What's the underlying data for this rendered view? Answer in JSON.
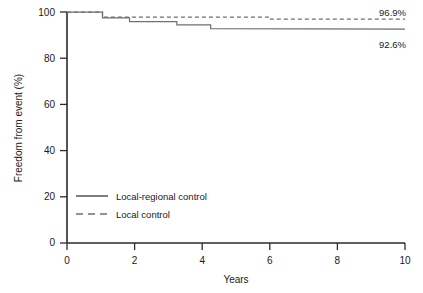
{
  "chart_data": {
    "type": "line",
    "title": "",
    "subtitle": "",
    "xlabel": "Years",
    "ylabel": "Freedom from event (%)",
    "xlim": [
      0,
      10
    ],
    "ylim": [
      0,
      100
    ],
    "xticks": [
      "0",
      "2",
      "4",
      "6",
      "8",
      "10"
    ],
    "xtick_values": [
      0,
      2,
      4,
      6,
      8,
      10
    ],
    "yticks": [
      "0",
      "20",
      "40",
      "60",
      "80",
      "100"
    ],
    "ytick_values": [
      0,
      20,
      40,
      60,
      80,
      100
    ],
    "grid": false,
    "legend_position": "inside-lower-left",
    "series": [
      {
        "name": "Local-regional control",
        "style": "solid",
        "color": "#6f6f6f",
        "endpoint_label": "92.6%",
        "endpoint_value": 92.6,
        "step_points": [
          [
            0.0,
            100.0
          ],
          [
            1.05,
            100.0
          ],
          [
            1.05,
            97.5
          ],
          [
            1.85,
            97.5
          ],
          [
            1.85,
            95.8
          ],
          [
            3.25,
            95.8
          ],
          [
            3.25,
            94.4
          ],
          [
            4.25,
            94.4
          ],
          [
            4.25,
            92.8
          ],
          [
            10.0,
            92.6
          ]
        ]
      },
      {
        "name": "Local control",
        "style": "dashed",
        "color": "#6f6f6f",
        "endpoint_label": "96.9%",
        "endpoint_value": 96.9,
        "step_points": [
          [
            0.0,
            100.0
          ],
          [
            1.05,
            100.0
          ],
          [
            1.05,
            97.8
          ],
          [
            6.0,
            97.8
          ],
          [
            6.0,
            96.9
          ],
          [
            10.0,
            96.9
          ]
        ]
      }
    ],
    "annotations": [
      {
        "text": "96.9%",
        "series": "Local control",
        "x": 10.0,
        "y": 96.9
      },
      {
        "text": "92.6%",
        "series": "Local-regional control",
        "x": 10.0,
        "y": 92.6
      }
    ]
  },
  "legend": {
    "items": [
      {
        "label": "Local-regional control",
        "style": "solid"
      },
      {
        "label": "Local control",
        "style": "dashed"
      }
    ]
  }
}
